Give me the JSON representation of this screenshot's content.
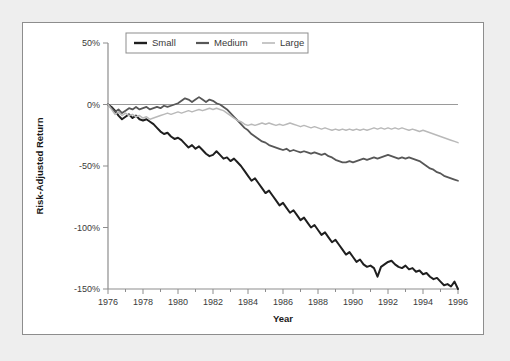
{
  "chart_data": {
    "type": "line",
    "title": "",
    "xlabel": "Year",
    "ylabel": "Risk-Adjusted Return",
    "xlim": [
      1976,
      1996
    ],
    "ylim": [
      -150,
      50
    ],
    "xticks": [
      1976,
      1978,
      1980,
      1982,
      1984,
      1986,
      1988,
      1990,
      1992,
      1994,
      1996
    ],
    "xtick_labels": [
      "1976",
      "1978",
      "1980",
      "1982",
      "1984",
      "1986",
      "1988",
      "1990",
      "1992",
      "1994",
      "1996"
    ],
    "yticks": [
      50,
      0,
      -50,
      -100,
      -150
    ],
    "ytick_labels": [
      "50%",
      "0%",
      "-50%",
      "-100%",
      "-150%"
    ],
    "minor_xticks_per_interval": 1,
    "grid": false,
    "zero_reference_line": true,
    "legend_position": "top-center",
    "legend_entries": [
      "Small",
      "Medium",
      "Large"
    ],
    "colors": {
      "small": "#1f1f1f",
      "medium": "#575757",
      "large": "#b9b9b9",
      "zero_line": "#9a9a9a",
      "axis": "#8d8d8d",
      "figure_background": "#ffffff",
      "page_background": "#eeeeee"
    },
    "series": [
      {
        "name": "Small",
        "color": "#1f1f1f",
        "width": 2.0,
        "x": [
          1976.0,
          1976.2,
          1976.4,
          1976.6,
          1976.8,
          1977.0,
          1977.2,
          1977.4,
          1977.6,
          1977.8,
          1978.0,
          1978.2,
          1978.4,
          1978.6,
          1978.8,
          1979.0,
          1979.2,
          1979.4,
          1979.6,
          1979.8,
          1980.0,
          1980.2,
          1980.4,
          1980.6,
          1980.8,
          1981.0,
          1981.2,
          1981.4,
          1981.6,
          1981.8,
          1982.0,
          1982.2,
          1982.4,
          1982.6,
          1982.8,
          1983.0,
          1983.2,
          1983.4,
          1983.6,
          1983.8,
          1984.0,
          1984.2,
          1984.4,
          1984.6,
          1984.8,
          1985.0,
          1985.2,
          1985.4,
          1985.6,
          1985.8,
          1986.0,
          1986.2,
          1986.4,
          1986.6,
          1986.8,
          1987.0,
          1987.2,
          1987.4,
          1987.6,
          1987.8,
          1988.0,
          1988.2,
          1988.4,
          1988.6,
          1988.8,
          1989.0,
          1989.2,
          1989.4,
          1989.6,
          1989.8,
          1990.0,
          1990.2,
          1990.4,
          1990.6,
          1990.8,
          1991.0,
          1991.2,
          1991.4,
          1991.6,
          1991.8,
          1992.0,
          1992.2,
          1992.4,
          1992.6,
          1992.8,
          1993.0,
          1993.2,
          1993.4,
          1993.6,
          1993.8,
          1994.0,
          1994.2,
          1994.4,
          1994.6,
          1994.8,
          1995.0,
          1995.2,
          1995.4,
          1995.6,
          1995.8,
          1996.0
        ],
        "y": [
          0,
          -2,
          -5,
          -9,
          -12,
          -10,
          -8,
          -11,
          -9,
          -12,
          -13,
          -12,
          -14,
          -16,
          -19,
          -22,
          -24,
          -23,
          -26,
          -28,
          -27,
          -29,
          -32,
          -35,
          -33,
          -36,
          -34,
          -37,
          -40,
          -42,
          -41,
          -38,
          -41,
          -44,
          -43,
          -46,
          -44,
          -47,
          -50,
          -54,
          -58,
          -62,
          -60,
          -64,
          -68,
          -72,
          -70,
          -74,
          -78,
          -82,
          -80,
          -84,
          -88,
          -86,
          -90,
          -94,
          -92,
          -96,
          -100,
          -98,
          -102,
          -106,
          -104,
          -108,
          -112,
          -110,
          -114,
          -118,
          -122,
          -120,
          -124,
          -128,
          -126,
          -130,
          -132,
          -131,
          -133,
          -140,
          -132,
          -130,
          -128,
          -127,
          -130,
          -132,
          -133,
          -131,
          -134,
          -133,
          -136,
          -135,
          -138,
          -137,
          -140,
          -142,
          -141,
          -144,
          -147,
          -146,
          -148,
          -144,
          -150
        ]
      },
      {
        "name": "Medium",
        "color": "#575757",
        "width": 1.8,
        "x": [
          1976.0,
          1976.2,
          1976.4,
          1976.6,
          1976.8,
          1977.0,
          1977.2,
          1977.4,
          1977.6,
          1977.8,
          1978.0,
          1978.2,
          1978.4,
          1978.6,
          1978.8,
          1979.0,
          1979.2,
          1979.4,
          1979.6,
          1979.8,
          1980.0,
          1980.2,
          1980.4,
          1980.6,
          1980.8,
          1981.0,
          1981.2,
          1981.4,
          1981.6,
          1981.8,
          1982.0,
          1982.2,
          1982.4,
          1982.6,
          1982.8,
          1983.0,
          1983.2,
          1983.4,
          1983.6,
          1983.8,
          1984.0,
          1984.2,
          1984.4,
          1984.6,
          1984.8,
          1985.0,
          1985.2,
          1985.4,
          1985.6,
          1985.8,
          1986.0,
          1986.2,
          1986.4,
          1986.6,
          1986.8,
          1987.0,
          1987.2,
          1987.4,
          1987.6,
          1987.8,
          1988.0,
          1988.2,
          1988.4,
          1988.6,
          1988.8,
          1989.0,
          1989.2,
          1989.4,
          1989.6,
          1989.8,
          1990.0,
          1990.2,
          1990.4,
          1990.6,
          1990.8,
          1991.0,
          1991.2,
          1991.4,
          1991.6,
          1991.8,
          1992.0,
          1992.2,
          1992.4,
          1992.6,
          1992.8,
          1993.0,
          1993.2,
          1993.4,
          1993.6,
          1993.8,
          1994.0,
          1994.2,
          1994.4,
          1994.6,
          1994.8,
          1995.0,
          1995.2,
          1995.4,
          1995.6,
          1995.8,
          1996.0
        ],
        "y": [
          0,
          -3,
          -6,
          -4,
          -7,
          -5,
          -3,
          -4,
          -2,
          -4,
          -3,
          -2,
          -4,
          -3,
          -2,
          -3,
          -1,
          -2,
          -1,
          0,
          1,
          3,
          5,
          4,
          2,
          4,
          6,
          4,
          2,
          4,
          3,
          1,
          0,
          -2,
          -4,
          -7,
          -10,
          -13,
          -16,
          -19,
          -21,
          -24,
          -26,
          -28,
          -30,
          -31,
          -33,
          -34,
          -35,
          -36,
          -37,
          -36,
          -38,
          -37,
          -38,
          -39,
          -38,
          -39,
          -40,
          -39,
          -40,
          -41,
          -40,
          -42,
          -43,
          -45,
          -46,
          -47,
          -47,
          -46,
          -47,
          -46,
          -45,
          -44,
          -45,
          -44,
          -43,
          -44,
          -43,
          -42,
          -41,
          -42,
          -43,
          -44,
          -43,
          -44,
          -43,
          -44,
          -45,
          -46,
          -48,
          -50,
          -52,
          -53,
          -55,
          -56,
          -58,
          -59,
          -60,
          -61,
          -62
        ]
      },
      {
        "name": "Large",
        "color": "#b9b9b9",
        "width": 1.5,
        "x": [
          1976.0,
          1976.2,
          1976.4,
          1976.6,
          1976.8,
          1977.0,
          1977.2,
          1977.4,
          1977.6,
          1977.8,
          1978.0,
          1978.2,
          1978.4,
          1978.6,
          1978.8,
          1979.0,
          1979.2,
          1979.4,
          1979.6,
          1979.8,
          1980.0,
          1980.2,
          1980.4,
          1980.6,
          1980.8,
          1981.0,
          1981.2,
          1981.4,
          1981.6,
          1981.8,
          1982.0,
          1982.2,
          1982.4,
          1982.6,
          1982.8,
          1983.0,
          1983.2,
          1983.4,
          1983.6,
          1983.8,
          1984.0,
          1984.2,
          1984.4,
          1984.6,
          1984.8,
          1985.0,
          1985.2,
          1985.4,
          1985.6,
          1985.8,
          1986.0,
          1986.2,
          1986.4,
          1986.6,
          1986.8,
          1987.0,
          1987.2,
          1987.4,
          1987.6,
          1987.8,
          1988.0,
          1988.2,
          1988.4,
          1988.6,
          1988.8,
          1989.0,
          1989.2,
          1989.4,
          1989.6,
          1989.8,
          1990.0,
          1990.2,
          1990.4,
          1990.6,
          1990.8,
          1991.0,
          1991.2,
          1991.4,
          1991.6,
          1991.8,
          1992.0,
          1992.2,
          1992.4,
          1992.6,
          1992.8,
          1993.0,
          1993.2,
          1993.4,
          1993.6,
          1993.8,
          1994.0,
          1994.2,
          1994.4,
          1994.6,
          1994.8,
          1995.0,
          1995.2,
          1995.4,
          1995.6,
          1995.8,
          1996.0
        ],
        "y": [
          0,
          -4,
          -8,
          -6,
          -9,
          -7,
          -9,
          -8,
          -10,
          -9,
          -11,
          -10,
          -12,
          -11,
          -10,
          -9,
          -8,
          -7,
          -8,
          -7,
          -6,
          -7,
          -6,
          -5,
          -6,
          -5,
          -4,
          -5,
          -4,
          -3,
          -4,
          -3,
          -4,
          -5,
          -7,
          -9,
          -11,
          -13,
          -14,
          -16,
          -17,
          -16,
          -17,
          -16,
          -15,
          -16,
          -15,
          -16,
          -17,
          -16,
          -17,
          -16,
          -15,
          -16,
          -17,
          -18,
          -17,
          -18,
          -19,
          -18,
          -19,
          -20,
          -19,
          -20,
          -21,
          -20,
          -21,
          -20,
          -21,
          -20,
          -21,
          -20,
          -21,
          -20,
          -21,
          -20,
          -19,
          -20,
          -19,
          -20,
          -19,
          -20,
          -19,
          -20,
          -19,
          -20,
          -21,
          -20,
          -21,
          -22,
          -21,
          -22,
          -23,
          -24,
          -25,
          -26,
          -27,
          -28,
          -29,
          -30,
          -31
        ]
      }
    ]
  },
  "legend": {
    "items": [
      {
        "label": "Small",
        "color": "#1f1f1f",
        "width": 2.4
      },
      {
        "label": "Medium",
        "color": "#575757",
        "width": 2.2
      },
      {
        "label": "Large",
        "color": "#b9b9b9",
        "width": 1.6
      }
    ]
  },
  "axes": {
    "y_title": "Risk-Adjusted Return",
    "x_title": "Year"
  }
}
